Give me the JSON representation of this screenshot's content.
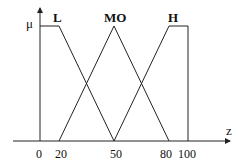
{
  "diagram": {
    "type": "fuzzy-membership-functions",
    "y_axis_label": "μ",
    "x_axis_label": "z",
    "x_ticks": [
      "0",
      "20",
      "50",
      "80",
      "100"
    ],
    "sets": [
      {
        "name": "L",
        "points": [
          [
            0,
            1
          ],
          [
            20,
            1
          ],
          [
            50,
            0
          ]
        ]
      },
      {
        "name": "MO",
        "points": [
          [
            20,
            0
          ],
          [
            50,
            1
          ],
          [
            80,
            0
          ]
        ]
      },
      {
        "name": "H",
        "points": [
          [
            50,
            0
          ],
          [
            80,
            1
          ],
          [
            100,
            1
          ],
          [
            100,
            0
          ]
        ]
      }
    ],
    "line_color": "#222222"
  }
}
